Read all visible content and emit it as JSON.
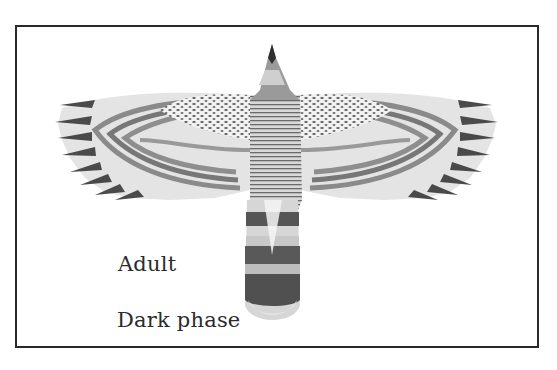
{
  "illustration": {
    "subject": "hawk in flight, dorsal view, wings spread",
    "frame_color": "#2a2a2a",
    "labels": {
      "age": "Adult",
      "morph": "Dark phase"
    }
  }
}
